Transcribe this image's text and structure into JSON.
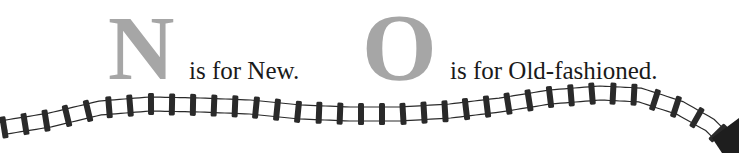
{
  "entries": [
    {
      "letter": "N",
      "caption": "is for New."
    },
    {
      "letter": "O",
      "caption": "is for Old-fashioned."
    }
  ],
  "colors": {
    "letter": "#a6a6a6",
    "caption": "#1a1a1a",
    "track": "#2a2a2a",
    "background": "#ffffff"
  },
  "decoration": {
    "track_icon": "railroad-track-icon",
    "train_icon": "locomotive-icon"
  }
}
